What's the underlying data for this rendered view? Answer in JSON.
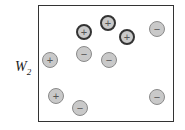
{
  "diagram": {
    "label_main": "W",
    "label_sub": "2",
    "charges": [
      {
        "sign": "+",
        "x": 84,
        "y": 32,
        "highlighted": true
      },
      {
        "sign": "+",
        "x": 108,
        "y": 23,
        "highlighted": true
      },
      {
        "sign": "+",
        "x": 127,
        "y": 37,
        "highlighted": true
      },
      {
        "sign": "−",
        "x": 157,
        "y": 29,
        "highlighted": false
      },
      {
        "sign": "+",
        "x": 50,
        "y": 60,
        "highlighted": false
      },
      {
        "sign": "−",
        "x": 84,
        "y": 54,
        "highlighted": false
      },
      {
        "sign": "−",
        "x": 109,
        "y": 60,
        "highlighted": false
      },
      {
        "sign": "+",
        "x": 56,
        "y": 96,
        "highlighted": false
      },
      {
        "sign": "−",
        "x": 80,
        "y": 108,
        "highlighted": false
      },
      {
        "sign": "−",
        "x": 157,
        "y": 97,
        "highlighted": false
      }
    ]
  }
}
